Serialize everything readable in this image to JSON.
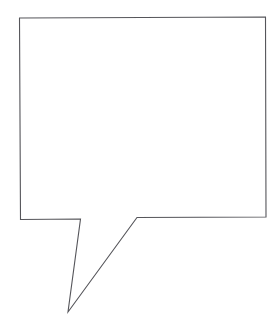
{
  "canvas": {
    "width": 279,
    "height": 335,
    "background_color": "#ffffff",
    "title": "Speech Bubble Outline"
  },
  "drawing": {
    "name": "speech-bubble",
    "description": "Hand-drawn style rectangular speech balloon with a narrow V-shaped tail pointing down and to the left",
    "stroke_color": "#55555a",
    "fill_color": "#ffffff",
    "stroke_width": 1.1,
    "style": "line-art outline, no fill pattern, no text inside"
  },
  "shape": {
    "type": "polygon",
    "closed": true,
    "vertices": [
      {
        "name": "top-left-corner",
        "x": 19.5,
        "y": 18.0
      },
      {
        "name": "top-right-corner",
        "x": 265.5,
        "y": 17.0
      },
      {
        "name": "bottom-right-corner",
        "x": 266.0,
        "y": 217.0
      },
      {
        "name": "tail-right-junction",
        "x": 137.0,
        "y": 217.5
      },
      {
        "name": "tail-tip",
        "x": 68.0,
        "y": 312.0
      },
      {
        "name": "tail-left-junction",
        "x": 80.5,
        "y": 219.0
      },
      {
        "name": "bottom-left-corner",
        "x": 20.5,
        "y": 219.5
      }
    ],
    "path_d": "M 19.5 18.0 L 265.5 17.0 L 266.0 217.0 L 137.0 217.5 L 68.0 312.0 L 80.5 219.0 L 20.5 219.5 Z"
  },
  "body_box": {
    "left": 19.5,
    "top": 17.0,
    "right": 266.0,
    "bottom": 219.5,
    "width": 246.5,
    "height": 202.5
  },
  "tail": {
    "orientation": "down-left",
    "tip_x": 68,
    "tip_y": 312,
    "opening_left_x": 80.5,
    "opening_right_x": 137.0,
    "opening_y": 218,
    "length": 94
  },
  "content": {
    "inside_text": "",
    "labels": []
  }
}
